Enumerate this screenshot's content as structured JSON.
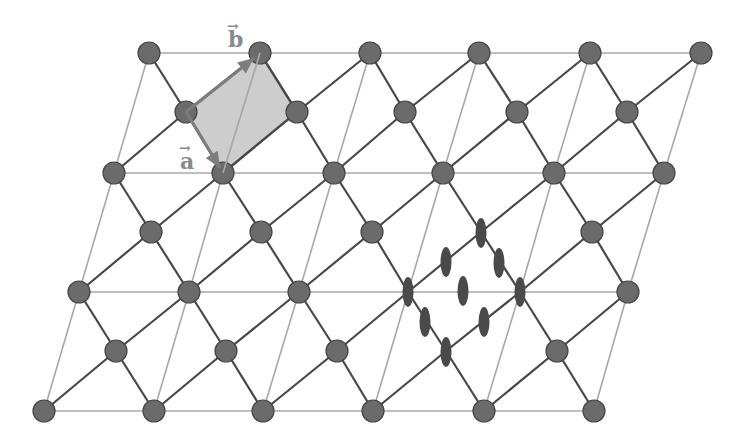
{
  "figure": {
    "type": "kagome-like lattice with unit cell",
    "labels": {
      "vector_a": "a",
      "vector_b": "b",
      "vector_arrow": "→"
    },
    "colors": {
      "node_fill": "#6b6b6b",
      "node_stroke": "#454545",
      "bond": "#474747",
      "thin_line": "#a8a8a8",
      "unit_cell_fill": "#c4c4c4",
      "vector": "#7d7d7d",
      "ellipse": "#4a4a4a"
    },
    "full_rows": [
      {
        "y": 53,
        "x": [
          149,
          260,
          370,
          479,
          590,
          701
        ]
      },
      {
        "y": 173,
        "x": [
          114,
          223,
          334,
          443,
          554,
          664
        ]
      },
      {
        "y": 292,
        "x": [
          79,
          189,
          299,
          408,
          520,
          628
        ]
      },
      {
        "y": 411,
        "x": [
          44,
          154,
          263,
          373,
          484,
          594
        ]
      }
    ],
    "half_rows": [
      {
        "y": 112,
        "x": [
          186,
          297,
          405,
          517,
          627
        ]
      },
      {
        "y": 232,
        "x": [
          151,
          261,
          372,
          481,
          592
        ]
      },
      {
        "y": 351,
        "x": [
          116,
          226,
          337,
          446,
          557
        ]
      }
    ],
    "ellipses": [
      {
        "x": 481,
        "y": 233
      },
      {
        "x": 446,
        "y": 262
      },
      {
        "x": 499,
        "y": 263
      },
      {
        "x": 408,
        "y": 292
      },
      {
        "x": 463,
        "y": 291
      },
      {
        "x": 520,
        "y": 292
      },
      {
        "x": 425,
        "y": 322
      },
      {
        "x": 484,
        "y": 322
      },
      {
        "x": 446,
        "y": 352
      }
    ],
    "unit_cell": {
      "points": [
        [
          186,
          112
        ],
        [
          260,
          53
        ],
        [
          297,
          112
        ],
        [
          223,
          173
        ]
      ]
    },
    "vector_a": {
      "from": [
        186,
        112
      ],
      "to": [
        220,
        168
      ]
    },
    "vector_b": {
      "from": [
        186,
        112
      ],
      "to": [
        254,
        58
      ]
    }
  }
}
